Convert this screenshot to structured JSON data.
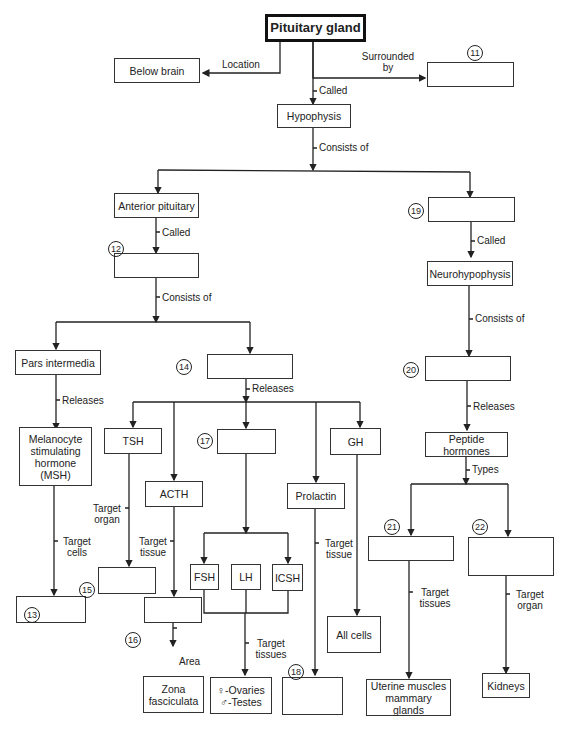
{
  "diagram": {
    "title": "Pituitary gland",
    "nodes": {
      "below_brain": "Below brain",
      "hypophysis": "Hypophysis",
      "anterior": "Anterior pituitary",
      "neurohypophysis": "Neurohypophysis",
      "pars_intermedia": "Pars intermedia",
      "msh": "Melanocyte stimulating hormone (MSH)",
      "tsh": "TSH",
      "acth": "ACTH",
      "gh": "GH",
      "prolactin": "Prolactin",
      "fsh": "FSH",
      "lh": "LH",
      "icsh": "ICSH",
      "peptide": "Peptide hormones",
      "all_cells": "All cells",
      "zona": "Zona fasciculata",
      "ovaries_testes": "♀-Ovaries ♂-Testes",
      "uterine": "Uterine muscles mammary glands",
      "kidneys": "Kidneys",
      "blank_11": "",
      "blank_12": "",
      "blank_13": "",
      "blank_14": "",
      "blank_15": "",
      "blank_16": "",
      "blank_17": "",
      "blank_18": "",
      "blank_19": "",
      "blank_20": "",
      "blank_21": "",
      "blank_22": ""
    },
    "numbers": [
      "11",
      "12",
      "13",
      "14",
      "15",
      "16",
      "17",
      "18",
      "19",
      "20",
      "21",
      "22"
    ],
    "edge_labels": {
      "location": "Location",
      "surrounded_by": "Surrounded by",
      "called_1": "Called",
      "consists_of_1": "Consists of",
      "called_2": "Called",
      "called_3": "Called",
      "consists_of_2": "Consists of",
      "consists_of_3": "Consists of",
      "releases_1": "Releases",
      "releases_2": "Releases",
      "releases_3": "Releases",
      "target_organ_1": "Target organ",
      "target_cells": "Target cells",
      "target_tissue_1": "Target tissue",
      "target_tissue_2": "Target tissue",
      "target_tissues_1": "Target tissues",
      "target_tissues_2": "Target tissues",
      "target_organ_2": "Target organ",
      "area": "Area",
      "types": "Types"
    }
  }
}
